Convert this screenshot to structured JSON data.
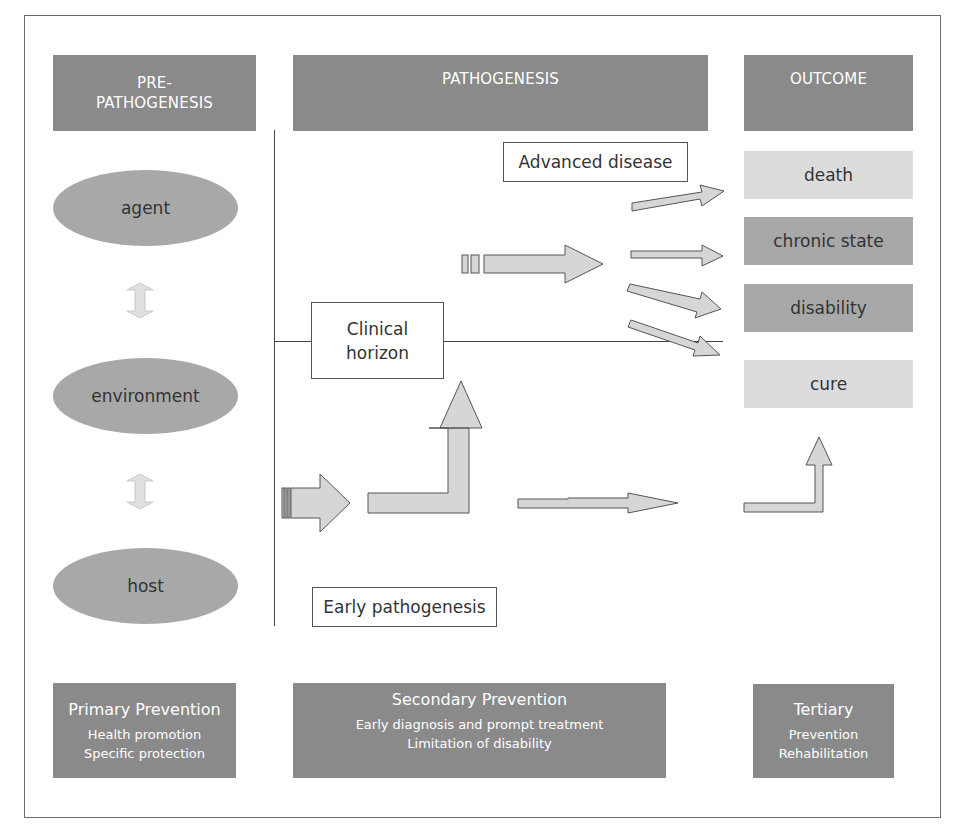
{
  "headers": {
    "pre_pathogenesis_line1": "PRE-",
    "pre_pathogenesis_line2": "PATHOGENESIS",
    "pathogenesis": "PATHOGENESIS",
    "outcome": "OUTCOME"
  },
  "factors": {
    "agent": "agent",
    "environment": "environment",
    "host": "host"
  },
  "labels": {
    "advanced_disease": "Advanced disease",
    "clinical_horizon_line1": "Clinical",
    "clinical_horizon_line2": "horizon",
    "early_pathogenesis": "Early pathogenesis"
  },
  "outcomes": [
    {
      "label": "death",
      "shade": "light"
    },
    {
      "label": "chronic state",
      "shade": "mid"
    },
    {
      "label": "disability",
      "shade": "mid"
    },
    {
      "label": "cure",
      "shade": "light"
    }
  ],
  "prevention": {
    "primary": {
      "title": "Primary Prevention",
      "lines": [
        "Health promotion",
        "Specific protection"
      ]
    },
    "secondary": {
      "title": "Secondary Prevention",
      "lines": [
        "Early diagnosis and prompt treatment",
        "Limitation of disability"
      ]
    },
    "tertiary": {
      "title": "Tertiary",
      "lines": [
        "Prevention",
        "Rehabilitation"
      ]
    }
  },
  "colors": {
    "dark_box": "#8a8a8a",
    "oval": "#a8a8a8",
    "light_box": "#dcdcdc",
    "arrow_fill": "#d6d6d6",
    "arrow_stroke": "#555555"
  }
}
